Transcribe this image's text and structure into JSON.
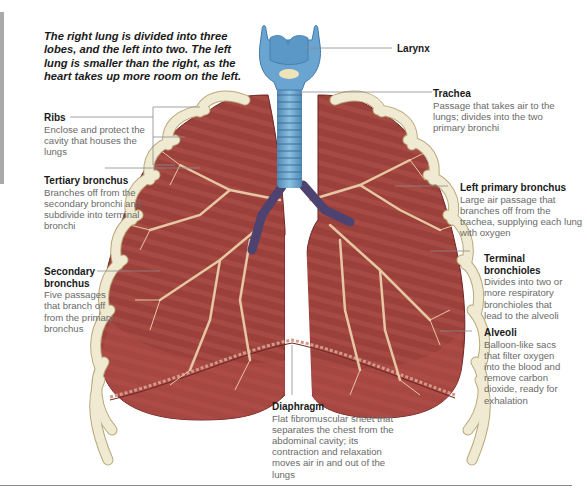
{
  "intro_text": "The right lung is divided into three lobes, and the left into two. The left lung is smaller than the right, as the heart takes up more room on the left.",
  "labels": {
    "larynx": {
      "title": "Larynx",
      "desc": ""
    },
    "trachea": {
      "title": "Trachea",
      "desc": "Passage that takes air to the lungs; divides into the two primary bronchi"
    },
    "ribs": {
      "title": "Ribs",
      "desc": "Enclose and protect the cavity that houses the lungs"
    },
    "tertiary_bronchus": {
      "title": "Tertiary bronchus",
      "desc": "Branches off from the secondary bronchi and subdivide into terminal bronchi"
    },
    "left_primary_bronchus": {
      "title": "Left primary bronchus",
      "desc": "Large air passage that branches off from the trachea, supplying each lung with oxygen"
    },
    "secondary_bronchus": {
      "title": "Secondary bronchus",
      "desc": "Five passages that branch off from the primary bronchus"
    },
    "terminal_bronchioles": {
      "title": "Terminal bronchioles",
      "desc": "Divides into two or more respiratory bronchioles that lead to the alveoli"
    },
    "alveoli": {
      "title": "Alveoli",
      "desc": "Balloon-like sacs that filter oxygen into the blood and remove carbon dioxide, ready for exhalation"
    },
    "diaphragm": {
      "title": "Diaphragm",
      "desc": "Flat fibromuscular sheet that separates the chest from the abdominal cavity; its contraction and relaxation moves air in and out of the lungs"
    }
  },
  "colors": {
    "lung": "#9a3d3a",
    "lung_dark": "#7a2a2a",
    "rib": "#efe8cf",
    "rib_edge": "#b9a878",
    "trachea": "#6fa6cf",
    "bronchus": "#5a4a78",
    "branch": "#e8c9a8",
    "leader": "#8a8a8a"
  }
}
